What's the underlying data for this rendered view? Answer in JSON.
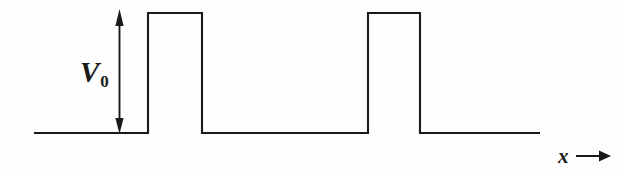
{
  "figure": {
    "kind": "physics-potential-energy-diagram",
    "background_color": "#fefefe",
    "line_color": "#1a1a1a",
    "width": 624,
    "height": 174
  },
  "labels": {
    "potential_symbol": "V",
    "potential_subscript": "0",
    "axis_symbol": "x",
    "axis_arrow_glyph": "⟶"
  },
  "chart_data": {
    "type": "line",
    "title": "",
    "xlabel": "x",
    "ylabel": "V_0",
    "grid": false,
    "legend": null,
    "baseline_value": 0,
    "barrier_value": 1,
    "barrier_height_label": "V_0",
    "axis_ranges": {
      "x_pixels": [
        34,
        540
      ],
      "y_pixels": [
        13,
        133
      ]
    },
    "barriers": [
      {
        "index": 1,
        "x_start_px": 148,
        "x_end_px": 202,
        "top_px": 13
      },
      {
        "index": 2,
        "x_start_px": 368,
        "x_end_px": 420,
        "top_px": 13
      }
    ],
    "points": [
      {
        "x": 34,
        "y": 0
      },
      {
        "x": 148,
        "y": 0
      },
      {
        "x": 148,
        "y": 1
      },
      {
        "x": 202,
        "y": 1
      },
      {
        "x": 202,
        "y": 0
      },
      {
        "x": 368,
        "y": 0
      },
      {
        "x": 368,
        "y": 1
      },
      {
        "x": 420,
        "y": 1
      },
      {
        "x": 420,
        "y": 0
      },
      {
        "x": 540,
        "y": 0
      }
    ],
    "annotations": [
      {
        "name": "height-measure-arrow",
        "text": "V_0",
        "kind": "double-headed-vertical-arrow",
        "x_px": 119.5,
        "y_top_px": 10,
        "y_bottom_px": 133
      },
      {
        "name": "x-axis-direction-arrow",
        "text": "x",
        "kind": "rightward-arrow",
        "x_start_px": 576,
        "x_end_px": 610,
        "y_px": 156
      }
    ]
  }
}
